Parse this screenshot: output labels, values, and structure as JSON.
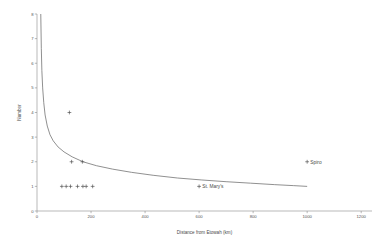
{
  "chart_data": {
    "type": "scatter",
    "title": "",
    "xlabel": "Distance from Etowah (km)",
    "ylabel": "Number",
    "xlim": [
      0,
      1240
    ],
    "ylim": [
      0,
      8
    ],
    "grid": false,
    "legend": null,
    "xticks": [
      0,
      200,
      400,
      600,
      800,
      1000,
      1200
    ],
    "yticks": [
      0,
      1,
      2,
      3,
      4,
      5,
      6,
      7,
      8
    ],
    "marker_symbol": "+",
    "points": [
      {
        "x": 120,
        "y": 4,
        "label": ""
      },
      {
        "x": 128,
        "y": 2,
        "label": ""
      },
      {
        "x": 168,
        "y": 2,
        "label": ""
      },
      {
        "x": 92,
        "y": 1,
        "label": ""
      },
      {
        "x": 108,
        "y": 1,
        "label": ""
      },
      {
        "x": 124,
        "y": 1,
        "label": ""
      },
      {
        "x": 150,
        "y": 1,
        "label": ""
      },
      {
        "x": 170,
        "y": 1,
        "label": ""
      },
      {
        "x": 182,
        "y": 1,
        "label": ""
      },
      {
        "x": 206,
        "y": 1,
        "label": ""
      },
      {
        "x": 600,
        "y": 1,
        "label": "St. Mary's"
      },
      {
        "x": 1000,
        "y": 2,
        "label": "Spiro"
      }
    ],
    "curve": {
      "description": "fitted power-law decay",
      "points": [
        {
          "x": 14,
          "y": 8.0
        },
        {
          "x": 16,
          "y": 6.6
        },
        {
          "x": 18,
          "y": 5.7
        },
        {
          "x": 21,
          "y": 5.0
        },
        {
          "x": 25,
          "y": 4.4
        },
        {
          "x": 30,
          "y": 3.9
        },
        {
          "x": 38,
          "y": 3.45
        },
        {
          "x": 48,
          "y": 3.1
        },
        {
          "x": 60,
          "y": 2.85
        },
        {
          "x": 78,
          "y": 2.6
        },
        {
          "x": 100,
          "y": 2.4
        },
        {
          "x": 130,
          "y": 2.2
        },
        {
          "x": 170,
          "y": 2.0
        },
        {
          "x": 220,
          "y": 1.84
        },
        {
          "x": 280,
          "y": 1.7
        },
        {
          "x": 350,
          "y": 1.57
        },
        {
          "x": 430,
          "y": 1.45
        },
        {
          "x": 520,
          "y": 1.34
        },
        {
          "x": 610,
          "y": 1.26
        },
        {
          "x": 700,
          "y": 1.19
        },
        {
          "x": 790,
          "y": 1.13
        },
        {
          "x": 880,
          "y": 1.07
        },
        {
          "x": 950,
          "y": 1.03
        },
        {
          "x": 1000,
          "y": 1.0
        }
      ]
    }
  }
}
